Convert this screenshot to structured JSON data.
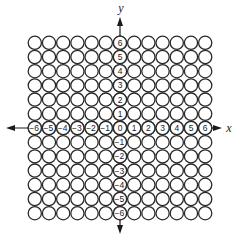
{
  "diagram": {
    "type": "coordinate-grid-of-circles",
    "rows": 13,
    "cols": 13,
    "center": {
      "x": 120,
      "y": 128
    },
    "pitch": 14.2,
    "radius": 6.6,
    "x_axis": {
      "label": "x",
      "ticks": [
        "-6",
        "-5",
        "-4",
        "-3",
        "-2",
        "-1",
        "0",
        "1",
        "2",
        "3",
        "4",
        "5",
        "6"
      ]
    },
    "y_axis": {
      "label": "y",
      "ticks": [
        "6",
        "5",
        "4",
        "3",
        "2",
        "1",
        "-1",
        "-2",
        "-3",
        "-4",
        "-5",
        "-6"
      ]
    },
    "colors": {
      "stroke": "#2a2a2a",
      "background": "#ffffff",
      "text": "#1a1a1a"
    }
  }
}
